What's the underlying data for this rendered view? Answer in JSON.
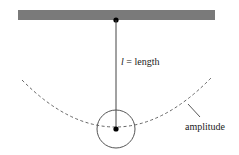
{
  "diagram": {
    "length_label": {
      "symbol": "l",
      "equals": " = ",
      "text": "length"
    },
    "amplitude_label": "amplitude",
    "colors": {
      "ceiling": "#7a7a7a",
      "line": "#444444",
      "dot": "#000000"
    }
  }
}
